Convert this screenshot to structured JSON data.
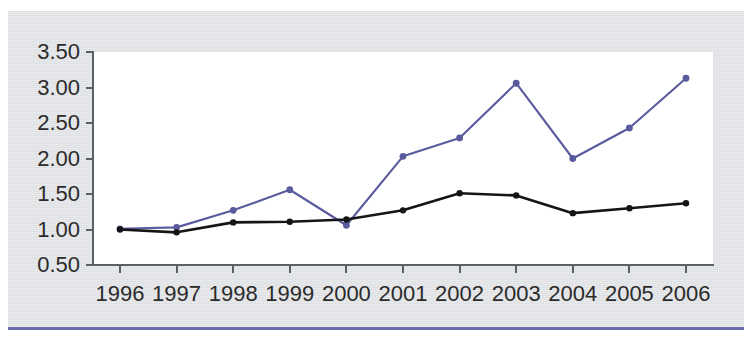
{
  "figure": {
    "title": "",
    "panel_color": "#dcdee1",
    "plot_background": "#ffffff",
    "bottom_rule_color": "#6b6bab"
  },
  "axes": {
    "y_tick_labels": [
      "3.50",
      "3.00",
      "2.50",
      "2.00",
      "1.50",
      "1.00",
      "0.50"
    ],
    "x_tick_labels": [
      "1996",
      "1997",
      "1998",
      "1999",
      "2000",
      "2001",
      "2002",
      "2003",
      "2004",
      "2005",
      "2006"
    ],
    "axis_line_color": "#5b6066",
    "tick_label_color": "#2b2b2b"
  },
  "chart_data": {
    "type": "line",
    "title": "",
    "xlabel": "",
    "ylabel": "",
    "x": [
      1996,
      1997,
      1998,
      1999,
      2000,
      2001,
      2002,
      2003,
      2004,
      2005,
      2006
    ],
    "categories": [
      "1996",
      "1997",
      "1998",
      "1999",
      "2000",
      "2001",
      "2002",
      "2003",
      "2004",
      "2005",
      "2006"
    ],
    "xlim": [
      1996,
      2006
    ],
    "ylim": [
      0.5,
      3.5
    ],
    "ytick_step": 0.5,
    "grid": false,
    "legend": "none",
    "series": [
      {
        "name": "blue-series",
        "color": "#5a5a9e",
        "marker": "circle",
        "values": [
          1.01,
          1.03,
          1.27,
          1.56,
          1.06,
          2.03,
          2.29,
          3.06,
          2.0,
          2.43,
          3.13
        ]
      },
      {
        "name": "black-series",
        "color": "#151515",
        "marker": "circle",
        "values": [
          1.0,
          0.96,
          1.1,
          1.11,
          1.14,
          1.27,
          1.51,
          1.48,
          1.23,
          1.3,
          1.37
        ]
      }
    ]
  }
}
